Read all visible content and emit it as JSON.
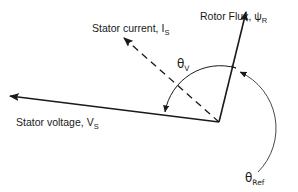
{
  "diagram": {
    "type": "phasor-diagram",
    "vectors": {
      "rotor_flux": {
        "label": "Rotor Flux, ",
        "symbol": "ψ",
        "subscript": "R",
        "style": "solid"
      },
      "stator_current": {
        "label": "Stator current, ",
        "symbol": "I",
        "subscript": "S",
        "style": "dashed"
      },
      "stator_voltage": {
        "label": "Stator voltage, ",
        "symbol": "V",
        "subscript": "S",
        "style": "solid"
      }
    },
    "angles": {
      "theta_v": {
        "symbol": "θ",
        "subscript": "V"
      },
      "theta_ref": {
        "symbol": "θ",
        "subscript": "Ref"
      }
    },
    "colors": {
      "line": "#1a1a1a",
      "arc": "#333333",
      "background": "#ffffff"
    }
  }
}
